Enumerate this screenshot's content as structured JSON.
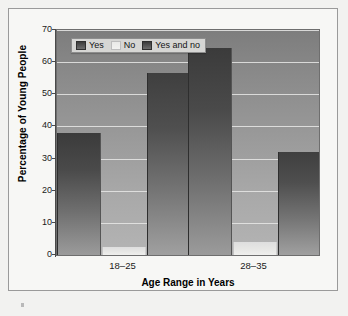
{
  "chart_data": {
    "type": "bar",
    "title": "",
    "categories": [
      "18–25",
      "28–35"
    ],
    "series": [
      {
        "name": "Yes",
        "values": [
          38,
          64.5
        ]
      },
      {
        "name": "No",
        "values": [
          2.5,
          4
        ]
      },
      {
        "name": "Yes and no",
        "values": [
          56.5,
          32
        ]
      }
    ],
    "xlabel": "Age Range in Years",
    "ylabel": "Percentage of Young People",
    "ylim": [
      0,
      70
    ],
    "yticks": [
      0,
      10,
      20,
      30,
      40,
      50,
      60,
      70
    ],
    "ytick_labels": [
      "0",
      "10",
      "20",
      "30",
      "40",
      "50",
      "60",
      "70"
    ],
    "grid": true,
    "legend_position": "upper-left-inside"
  },
  "legend": {
    "items": [
      {
        "label": "Yes",
        "swatch": "dark-gradient-swatch"
      },
      {
        "label": "No",
        "swatch": "light-gradient-swatch"
      },
      {
        "label": "Yes and no",
        "swatch": "dark-gradient-swatch"
      }
    ]
  },
  "axes": {
    "y_title": "Percentage of Young People",
    "x_title": "Age Range in Years"
  }
}
